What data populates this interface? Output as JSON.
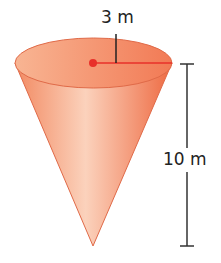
{
  "figure": {
    "shape": "cone",
    "radius_label": "3 m",
    "height_label": "10 m",
    "colors": {
      "cone_fill_light": "#f9c4a8",
      "cone_fill_dark": "#f0764e",
      "cone_edge": "#e06a48",
      "center_dot": "#e8302a",
      "radius_line": "#e8302a",
      "dimension_line": "#333333"
    }
  }
}
